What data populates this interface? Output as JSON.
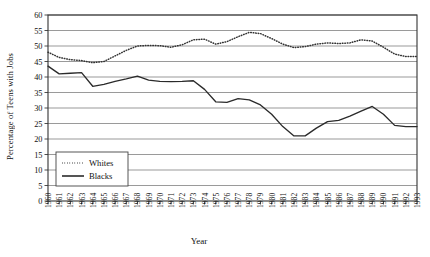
{
  "chart_data": {
    "type": "line",
    "title": "",
    "xlabel": "Year",
    "ylabel": "Percentage of Teens with Jobs",
    "xlim": [
      1960,
      1993
    ],
    "ylim": [
      0,
      60
    ],
    "ytick_step": 5,
    "grid": "horizontal",
    "legend_position": "lower-left-inside",
    "x": [
      1960,
      1961,
      1962,
      1963,
      1964,
      1965,
      1966,
      1967,
      1968,
      1969,
      1970,
      1971,
      1972,
      1973,
      1974,
      1975,
      1976,
      1977,
      1978,
      1979,
      1980,
      1981,
      1982,
      1983,
      1984,
      1985,
      1986,
      1987,
      1988,
      1989,
      1990,
      1991,
      1992,
      1993
    ],
    "xticklabels": [
      "1960",
      "1961",
      "1962",
      "1963",
      "1964",
      "1965",
      "1966",
      "1967",
      "1968",
      "1969",
      "1970",
      "1971",
      "1972",
      "1973",
      "1974",
      "1975",
      "1976",
      "1977",
      "1978",
      "1979",
      "1980",
      "1981",
      "1982",
      "1983",
      "1984",
      "1985",
      "1986",
      "1987",
      "1988",
      "1989",
      "1990",
      "1991",
      "1992",
      "1993"
    ],
    "yticklabels": [
      "0",
      "5",
      "10",
      "15",
      "20",
      "25",
      "30",
      "35",
      "40",
      "45",
      "50",
      "55",
      "60"
    ],
    "series": [
      {
        "name": "Whites",
        "style": "dotted",
        "color": "#333333",
        "values": [
          48.0,
          46.3,
          45.6,
          45.3,
          44.6,
          45.0,
          46.8,
          48.6,
          50.0,
          50.2,
          50.1,
          49.6,
          50.4,
          52.0,
          52.2,
          50.6,
          51.4,
          53.0,
          54.4,
          54.0,
          52.4,
          50.6,
          49.5,
          49.8,
          50.6,
          51.0,
          50.8,
          51.0,
          52.0,
          51.6,
          49.6,
          47.4,
          46.6,
          46.6
        ]
      },
      {
        "name": "Blacks",
        "style": "solid",
        "color": "#2b2b2b",
        "values": [
          43.5,
          41.0,
          41.2,
          41.4,
          37.0,
          37.6,
          38.6,
          39.4,
          40.3,
          39.0,
          38.6,
          38.5,
          38.6,
          38.8,
          36.0,
          32.0,
          31.8,
          33.0,
          32.6,
          31.0,
          28.0,
          24.0,
          21.0,
          21.0,
          23.5,
          25.6,
          26.0,
          27.4,
          29.0,
          30.5,
          28.0,
          24.4,
          24.0,
          24.0
        ]
      }
    ]
  },
  "legend": {
    "items": [
      {
        "label": "Whites"
      },
      {
        "label": "Blacks"
      }
    ]
  }
}
